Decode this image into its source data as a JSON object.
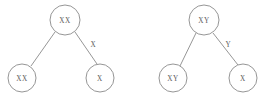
{
  "figure": {
    "background_color": "#ffffff",
    "stroke_color": "#8a8a8a",
    "text_color": "#5a5a5a",
    "node_fill": "#ffffff"
  },
  "diagrams": [
    {
      "id": "left-diagram",
      "name": "female-chromosome-tree",
      "parent": {
        "label": "XX",
        "cx": 65,
        "cy": 20,
        "r": 15
      },
      "children": [
        {
          "label": "XX",
          "cx": 22,
          "cy": 78,
          "r": 14,
          "edge_label": ""
        },
        {
          "label": "X",
          "cx": 100,
          "cy": 78,
          "r": 14,
          "edge_label": "X"
        }
      ],
      "edge_label_positions": [
        {
          "label": "X",
          "x": 93,
          "y": 45
        }
      ]
    },
    {
      "id": "right-diagram",
      "name": "male-chromosome-tree",
      "parent": {
        "label": "XY",
        "cx": 204,
        "cy": 20,
        "r": 15
      },
      "children": [
        {
          "label": "XY",
          "cx": 173,
          "cy": 78,
          "r": 14,
          "edge_label": ""
        },
        {
          "label": "X",
          "cx": 243,
          "cy": 78,
          "r": 14,
          "edge_label": "Y"
        }
      ],
      "edge_label_positions": [
        {
          "label": "Y",
          "x": 228,
          "y": 45
        }
      ]
    }
  ],
  "labels": {
    "left_parent": "XX",
    "left_child_a": "XX",
    "left_child_b": "X",
    "left_edge": "X",
    "right_parent": "XY",
    "right_child_a": "XY",
    "right_child_b": "X",
    "right_edge": "Y"
  }
}
